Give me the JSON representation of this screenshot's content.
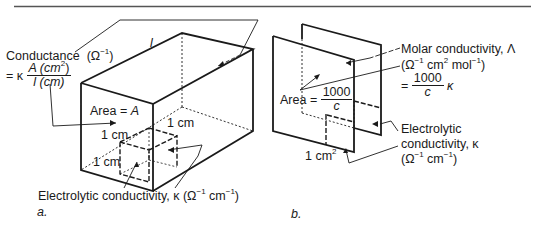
{
  "panel_a": {
    "caption": "a.",
    "conductance": {
      "title": "Conductance",
      "unit": "(Ω",
      "unit_exp": "−1",
      "unit_close": ")",
      "eq_prefix": "= κ",
      "frac_num": "A (cm",
      "frac_num_exp": "2",
      "frac_num_close": ")",
      "frac_den": "l (cm)"
    },
    "length_label": "l",
    "area_label": "Area = ",
    "area_var": "A",
    "cm_top": "1 cm",
    "cm_right": "1 cm",
    "cm_left": "1 cm",
    "electrolytic": {
      "text": "Electrolytic conductivity, κ (Ω",
      "exp1": "−1",
      "mid": " cm",
      "exp2": "−1",
      "close": ")"
    }
  },
  "panel_b": {
    "caption": "b.",
    "area_label": "Area =",
    "area_num": "1000",
    "area_den": "c",
    "cm2": "1 cm",
    "cm2_exp": "2",
    "molar": {
      "title": "Molar conductivity, Λ",
      "unit_a": "(Ω",
      "exp1": "−1",
      "unit_b": " cm",
      "exp2": "2",
      "unit_c": " mol",
      "exp3": "−1",
      "unit_d": ")",
      "eq": "=",
      "frac_num": "1000",
      "frac_den": "c",
      "suffix": "κ"
    },
    "electrolytic": {
      "line1": "Electrolytic",
      "line2": "conductivity, κ",
      "unit_a": "(Ω",
      "exp1": "−1",
      "unit_b": " cm",
      "exp2": "−1",
      "unit_c": ")"
    }
  }
}
